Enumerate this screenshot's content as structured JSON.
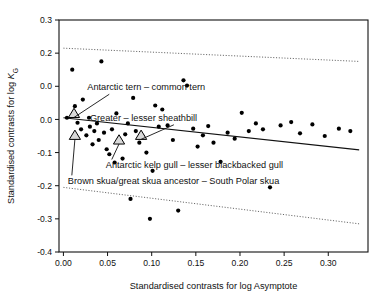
{
  "chart_data": {
    "type": "scatter",
    "title": "",
    "xlabel": "Standardised contrasts for log Asymptote",
    "ylabel": "Standardised contrasts for log Kɢ",
    "ylabel_parts": {
      "prefix": "Standardised contrasts for log ",
      "symbol": "K",
      "subscript": "G"
    },
    "xlim": [
      -0.005,
      0.345
    ],
    "ylim": [
      -0.4,
      0.3
    ],
    "xticks": [
      0.0,
      0.05,
      0.1,
      0.15,
      0.2,
      0.25,
      0.3
    ],
    "xtick_labels": [
      "0.00",
      "0.05",
      "0.10",
      "0.15",
      "0.20",
      "0.25",
      "0.30"
    ],
    "yticks": [
      0.3,
      0.2,
      0.1,
      0.0,
      -0.1,
      -0.2,
      -0.3,
      -0.4
    ],
    "ytick_labels": [
      "0.3",
      "0.2",
      "0.0",
      "0.0",
      "-0.1",
      "-0.2",
      "-0.3",
      "-0.4"
    ],
    "grid": false,
    "legend": "none",
    "regression_line": {
      "name": "fitted regression through origin",
      "x": [
        0.0,
        0.335
      ],
      "y": [
        0.005,
        -0.092
      ],
      "style": "solid"
    },
    "confidence_bands": [
      {
        "name": "upper 95% band",
        "x": [
          0.0,
          0.335
        ],
        "y": [
          0.215,
          0.175
        ],
        "style": "dotted"
      },
      {
        "name": "lower 95% band",
        "x": [
          0.0,
          0.335
        ],
        "y": [
          -0.205,
          -0.315
        ],
        "style": "dotted"
      }
    ],
    "series": [
      {
        "name": "contrasts",
        "marker": "filled-circle",
        "points": [
          [
            0.004,
            0.005
          ],
          [
            0.01,
            0.15
          ],
          [
            0.013,
            0.04
          ],
          [
            0.016,
            -0.01
          ],
          [
            0.02,
            -0.03
          ],
          [
            0.022,
            0.06
          ],
          [
            0.026,
            -0.048
          ],
          [
            0.029,
            0.005
          ],
          [
            0.03,
            -0.022
          ],
          [
            0.033,
            -0.075
          ],
          [
            0.035,
            -0.035
          ],
          [
            0.038,
            -0.012
          ],
          [
            0.04,
            -0.062
          ],
          [
            0.043,
            0.175
          ],
          [
            0.046,
            -0.04
          ],
          [
            0.049,
            -0.09
          ],
          [
            0.052,
            -0.105
          ],
          [
            0.055,
            -0.03
          ],
          [
            0.058,
            -0.13
          ],
          [
            0.06,
            0.018
          ],
          [
            0.063,
            -0.058
          ],
          [
            0.067,
            -0.118
          ],
          [
            0.07,
            -0.045
          ],
          [
            0.073,
            -0.012
          ],
          [
            0.076,
            -0.24
          ],
          [
            0.079,
            0.065
          ],
          [
            0.082,
            -0.035
          ],
          [
            0.086,
            -0.07
          ],
          [
            0.09,
            -0.052
          ],
          [
            0.094,
            -0.1
          ],
          [
            0.098,
            -0.3
          ],
          [
            0.101,
            -0.155
          ],
          [
            0.104,
            0.042
          ],
          [
            0.108,
            -0.022
          ],
          [
            0.112,
            0.03
          ],
          [
            0.118,
            -0.018
          ],
          [
            0.124,
            -0.062
          ],
          [
            0.13,
            -0.275
          ],
          [
            0.136,
            0.118
          ],
          [
            0.14,
            0.102
          ],
          [
            0.147,
            -0.028
          ],
          [
            0.152,
            -0.082
          ],
          [
            0.158,
            -0.048
          ],
          [
            0.164,
            -0.02
          ],
          [
            0.17,
            -0.07
          ],
          [
            0.178,
            -0.128
          ],
          [
            0.186,
            -0.04
          ],
          [
            0.194,
            -0.058
          ],
          [
            0.202,
            0.02
          ],
          [
            0.21,
            -0.035
          ],
          [
            0.218,
            -0.012
          ],
          [
            0.226,
            -0.03
          ],
          [
            0.234,
            -0.205
          ],
          [
            0.246,
            -0.018
          ],
          [
            0.258,
            -0.008
          ],
          [
            0.268,
            -0.042
          ],
          [
            0.282,
            -0.015
          ],
          [
            0.296,
            -0.05
          ],
          [
            0.312,
            -0.028
          ],
          [
            0.325,
            -0.035
          ]
        ]
      },
      {
        "name": "highlighted contrasts",
        "marker": "open-triangle",
        "points": [
          [
            0.012,
            0.018
          ],
          [
            0.013,
            -0.048
          ],
          [
            0.063,
            -0.062
          ],
          [
            0.088,
            -0.048
          ]
        ]
      }
    ],
    "annotations": [
      {
        "id": "antarctic-tern",
        "text": "Antarctic tern – common tern",
        "text_xy": [
          0.027,
          0.088
        ],
        "target_xy": [
          0.012,
          0.018
        ]
      },
      {
        "id": "sheathbill",
        "text": "Greater – lesser sheathbill",
        "text_xy": [
          0.03,
          -0.004
        ],
        "target_xy": [
          0.088,
          -0.048
        ]
      },
      {
        "id": "kelp-gull",
        "text": "Antarctic kelp gull – lesser blackbacked gull",
        "text_xy": [
          0.048,
          -0.148
        ],
        "target_xy": [
          0.063,
          -0.062
        ]
      },
      {
        "id": "skua",
        "text": "Brown skua/great skua ancestor – South Polar skua",
        "text_xy": [
          0.005,
          -0.196
        ],
        "target_xy": [
          0.013,
          -0.048
        ]
      }
    ]
  }
}
